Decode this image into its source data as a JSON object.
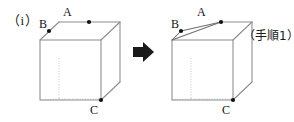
{
  "figure": {
    "enumeration_label": "（i）",
    "step_caption": "（手順1）",
    "arrow_icon": "right-arrow-icon",
    "colors": {
      "edge_visible": "#8c8c8c",
      "edge_hidden": "#b5b5b5",
      "cut_edge": "#6e6e6e",
      "vertex_dot": "#111111",
      "text": "#1a1a1a",
      "arrow": "#1a1a1a",
      "background": "#ffffff"
    },
    "cubes": [
      {
        "name": "cube-before",
        "caption": "",
        "points": [
          {
            "id": "A",
            "label": "A",
            "position": "top-back-edge-midpoint"
          },
          {
            "id": "B",
            "label": "B",
            "position": "top-left-back-edge"
          },
          {
            "id": "C",
            "label": "C",
            "position": "bottom-front-right-vertex"
          }
        ],
        "cut": false
      },
      {
        "name": "cube-after",
        "caption": "（手順1）",
        "points": [
          {
            "id": "A",
            "label": "A",
            "position": "top-back-edge-midpoint"
          },
          {
            "id": "B",
            "label": "B",
            "position": "top-left-back-edge"
          },
          {
            "id": "C",
            "label": "C",
            "position": "bottom-front-right-vertex"
          }
        ],
        "cut": true,
        "cut_description": "corner sliced through A, B and top-front-left vertex"
      }
    ]
  }
}
